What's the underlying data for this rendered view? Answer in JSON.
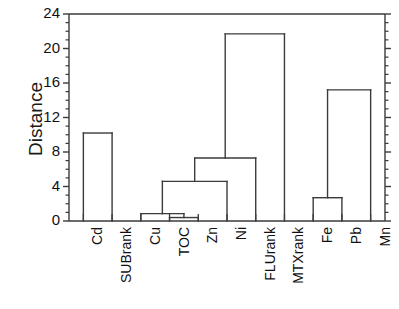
{
  "chart_data": {
    "type": "line",
    "subtype": "dendrogram",
    "title": "",
    "xlabel": "",
    "ylabel": "Distance",
    "ylim": [
      0,
      24
    ],
    "ytick_values": [
      0,
      4,
      8,
      12,
      16,
      20,
      24
    ],
    "ytick_labels": [
      "0",
      "4",
      "8",
      "12",
      "16",
      "20",
      "24"
    ],
    "minor_ticks_per_interval": 4,
    "grid": false,
    "legend": null,
    "orientation": "vertical",
    "leaf_labels": [
      "Cd",
      "SUBrank",
      "Cu",
      "TOC",
      "Zn",
      "Ni",
      "FLUrank",
      "MTXrank",
      "Fe",
      "Pb",
      "Mn"
    ],
    "leaf_label_rotation_deg": -90,
    "merges": [
      {
        "id": "m1",
        "label": "TOC + Zn",
        "left": "TOC",
        "right": "Zn",
        "height": 0.4
      },
      {
        "id": "m2",
        "label": "Cu + (TOC,Zn)",
        "left": "Cu",
        "right": "m1",
        "height": 0.85
      },
      {
        "id": "m3",
        "label": "(Cu,TOC,Zn) + Ni",
        "left": "m2",
        "right": "Ni",
        "height": 4.6
      },
      {
        "id": "m4",
        "label": "(Cu,TOC,Zn,Ni) + FLUrank",
        "left": "m3",
        "right": "FLUrank",
        "height": 7.3
      },
      {
        "id": "m5",
        "label": "Cd + SUBrank",
        "left": "Cd",
        "right": "SUBrank",
        "height": 10.2
      },
      {
        "id": "m6",
        "label": "Fe + Pb",
        "left": "Fe",
        "right": "Pb",
        "height": 2.7
      },
      {
        "id": "m7",
        "label": "(Fe,Pb) + Mn",
        "left": "m6",
        "right": "Mn",
        "height": 15.2
      },
      {
        "id": "m8",
        "label": "(Cu,TOC,Zn,Ni,FLUrank) + MTXrank",
        "left": "m4",
        "right": "MTXrank",
        "height": 21.7
      }
    ],
    "colors": {
      "line": "#3b3b3b",
      "axis": "#3b3b3b",
      "text": "#111111",
      "background": "#ffffff"
    }
  },
  "axis": {
    "y_title": "Distance"
  }
}
